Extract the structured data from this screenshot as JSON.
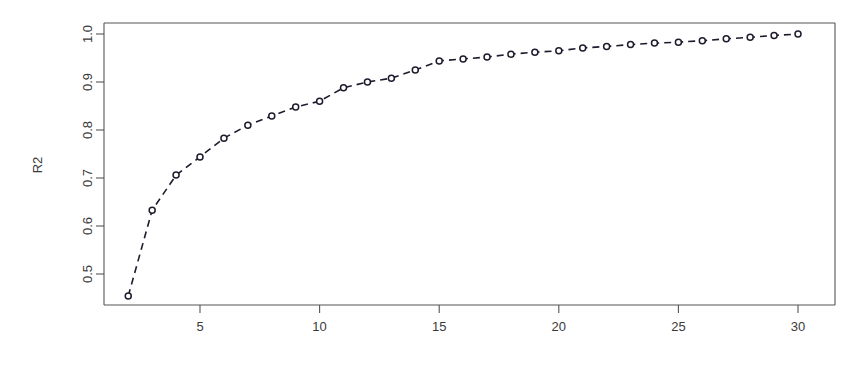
{
  "chart_data": {
    "type": "line",
    "title": "",
    "xlabel": "",
    "ylabel": "R2",
    "xlim": [
      2,
      30
    ],
    "ylim": [
      0.45,
      1.005
    ],
    "grid": false,
    "legend": null,
    "marker": "open-circle",
    "linestyle": "dashed",
    "x": [
      2,
      3,
      4,
      5,
      6,
      7,
      8,
      9,
      10,
      11,
      12,
      13,
      14,
      15,
      16,
      17,
      18,
      19,
      20,
      21,
      22,
      23,
      24,
      25,
      26,
      27,
      28,
      29,
      30
    ],
    "values": [
      0.454,
      0.633,
      0.706,
      0.744,
      0.783,
      0.81,
      0.829,
      0.848,
      0.86,
      0.888,
      0.9,
      0.908,
      0.925,
      0.944,
      0.948,
      0.952,
      0.958,
      0.962,
      0.965,
      0.971,
      0.974,
      0.978,
      0.981,
      0.983,
      0.986,
      0.99,
      0.993,
      0.997,
      1.0
    ],
    "x_ticks": [
      5,
      10,
      15,
      20,
      25,
      30
    ],
    "x_tick_labels": [
      "5",
      "10",
      "15",
      "20",
      "25",
      "30"
    ],
    "y_ticks": [
      0.5,
      0.6,
      0.7,
      0.8,
      0.9,
      1.0
    ],
    "y_tick_labels": [
      "0.5",
      "0.6",
      "0.7",
      "0.8",
      "0.9",
      "1.0"
    ],
    "series_name": "R2"
  },
  "axes": {
    "y_axis_title": "R2"
  },
  "colors": {
    "line": "#1c1c2e",
    "marker_fill": "#ffffff",
    "axis": "#555555",
    "text": "#3a3a3a",
    "background": "#ffffff"
  }
}
